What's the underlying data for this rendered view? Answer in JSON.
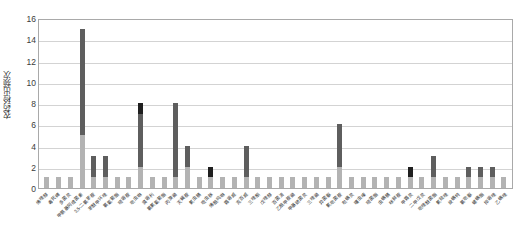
{
  "chart_data": {
    "type": "bar",
    "title": "",
    "subtitle": "",
    "xlabel": "",
    "ylabel": "农药检出频次",
    "ylim": [
      0,
      16
    ],
    "ytick_labels": [
      "0",
      "2",
      "4",
      "6",
      "8",
      "10",
      "12",
      "14",
      "16"
    ],
    "ytick_values": [
      0,
      2,
      4,
      6,
      8,
      10,
      12,
      14,
      16
    ],
    "grid": true,
    "grid_axis": "y",
    "legend": null,
    "legend_position": "none",
    "stacked": true,
    "bar_style": "stacked-vertical",
    "colors": {
      "segment_lower": "#b3b3b3",
      "segment_upper": "#5e5e5e",
      "segment_cap": "#1f1f1f",
      "plot_border": "#a9a9a9",
      "gridline": "#d3d3d3",
      "background": "#ffffff",
      "text": "#2f2f2f"
    },
    "series": [
      {
        "name": "下层",
        "color": "#b3b3b3",
        "values": [
          1,
          1,
          1,
          5,
          1,
          1,
          1,
          1,
          2,
          1,
          1,
          1,
          2,
          1,
          1,
          1,
          1,
          1,
          1,
          1,
          1,
          1,
          1,
          1,
          1,
          2,
          1,
          1,
          1,
          1,
          1,
          1,
          1,
          1,
          1,
          1,
          1,
          1,
          1,
          1
        ]
      },
      {
        "name": "上层",
        "color": "#5e5e5e",
        "values": [
          0,
          0,
          0,
          10,
          2,
          2,
          0,
          0,
          5,
          0,
          0,
          7,
          2,
          0,
          0,
          0,
          0,
          3,
          0,
          0,
          0,
          0,
          0,
          0,
          0,
          4,
          0,
          0,
          0,
          0,
          0,
          0,
          0,
          2,
          0,
          0,
          1,
          1,
          1,
          0
        ]
      },
      {
        "name": "顶层",
        "color": "#1f1f1f",
        "values": [
          0,
          0,
          0,
          0,
          0,
          0,
          0,
          0,
          1,
          0,
          0,
          0,
          0,
          0,
          1,
          0,
          0,
          0,
          0,
          0,
          0,
          0,
          0,
          0,
          0,
          0,
          0,
          0,
          0,
          0,
          0,
          1,
          0,
          0,
          0,
          0,
          0,
          0,
          0,
          0
        ]
      }
    ],
    "totals": [
      1,
      1,
      1,
      15,
      3,
      3,
      1,
      1,
      8,
      1,
      1,
      8,
      4,
      1,
      2,
      1,
      1,
      4,
      1,
      1,
      1,
      1,
      1,
      1,
      1,
      6,
      1,
      1,
      1,
      1,
      1,
      2,
      1,
      3,
      1,
      1,
      2,
      2,
      2,
      1
    ],
    "categories": [
      "烯唑醇",
      "毒死蜱",
      "多菌灵",
      "甲氨基阿维菌素",
      "3,5-二氯苯胺",
      "苯醚甲环唑",
      "氯氰菊酯",
      "嘧霉胺",
      "吡虫啉",
      "腐霉利",
      "氯氟氰菊酯",
      "丙溴磷",
      "灭蝇胺",
      "氟虫腈",
      "啶虫脒",
      "烯酰吗啉",
      "霜霉威",
      "克百威",
      "三唑酮",
      "戊唑醇",
      "百菌清",
      "乙酰甲胺磷",
      "甲基硫菌灵",
      "三唑磷",
      "异菌脲",
      "氟吡菌胺",
      "哒螨灵",
      "噻虫嗪",
      "嘧菌酯",
      "虫螨腈",
      "咪鲜胺",
      "甲霜灵",
      "二甲戊灵",
      "吡唑醚菌酯",
      "氟硅唑",
      "炔螨特",
      "氯吡脲",
      "螺螨酯",
      "抑霉唑",
      "乙螨唑"
    ]
  }
}
